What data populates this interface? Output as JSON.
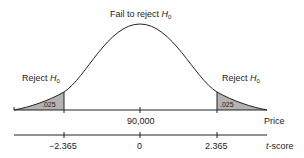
{
  "diagram": {
    "type": "two-tailed hypothesis test (t-distribution)",
    "center_label": {
      "text": "Fail to reject ",
      "symbol": "H",
      "subscript": "0"
    },
    "left_reject_label": {
      "text": "Reject ",
      "symbol": "H",
      "subscript": "0"
    },
    "right_reject_label": {
      "text": "Reject ",
      "symbol": "H",
      "subscript": "0"
    },
    "left_tail_area": ".025",
    "right_tail_area": ".025",
    "price_axis": {
      "label": "Price",
      "center_value": "90,000"
    },
    "t_axis": {
      "label_prefix": "t",
      "label_suffix": "-score",
      "ticks": [
        "−2.365",
        "0",
        "2.365"
      ]
    },
    "colors": {
      "line": "#222222",
      "shade": "#b3b3b3",
      "background": "#ffffff"
    }
  }
}
